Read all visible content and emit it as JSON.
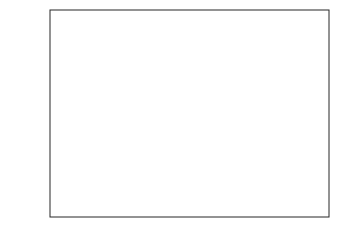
{
  "chart_data": {
    "type": "boxplot",
    "title": "",
    "xlabel": "",
    "ylabel": "Values",
    "ylim": [
      193,
      425
    ],
    "yticks": [
      200,
      250,
      300,
      350,
      400
    ],
    "notched": true,
    "grid": false,
    "series": [
      {
        "name": "1",
        "whisker_low": 210,
        "q1": 300,
        "median": 350,
        "q3": 400,
        "whisker_high": 412,
        "outliers": []
      },
      {
        "name": "2",
        "whisker_low": 209,
        "q1": 259,
        "median": 306,
        "q3": 380,
        "whisker_high": 402,
        "outliers": []
      },
      {
        "name": "3",
        "whisker_low": 200,
        "q1": 206,
        "median": 209,
        "q3": 229,
        "whisker_high": 203,
        "outliers": [
          299,
          289
        ]
      }
    ]
  },
  "axis": {
    "ylabel": "Values",
    "ticks": [
      "200",
      "250",
      "300",
      "350",
      "400"
    ]
  }
}
